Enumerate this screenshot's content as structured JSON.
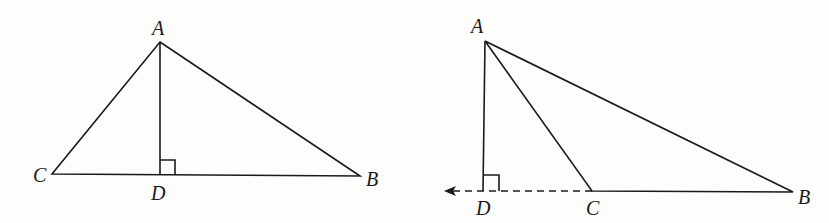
{
  "figures": [
    {
      "name": "acute-triangle",
      "labels": {
        "A": "A",
        "B": "B",
        "C": "C",
        "D": "D"
      },
      "points": {
        "A": [
          160,
          42
        ],
        "B": [
          360,
          176
        ],
        "C": [
          52,
          174
        ],
        "D": [
          160,
          175
        ]
      },
      "notes": "Altitude AD drawn inside triangle ABC with right-angle marker at D"
    },
    {
      "name": "obtuse-triangle",
      "labels": {
        "A": "A",
        "B": "B",
        "C": "C",
        "D": "D"
      },
      "points": {
        "A": [
          485,
          41
        ],
        "B": [
          793,
          192
        ],
        "C": [
          592,
          191
        ],
        "D": [
          483,
          191
        ]
      },
      "notes": "Side BC extended (dashed, with arrow) past C to D; altitude AD outside triangle with right-angle marker at D"
    }
  ],
  "colors": {
    "stroke": "#1a1a1a",
    "background": "#fdfdfc"
  }
}
